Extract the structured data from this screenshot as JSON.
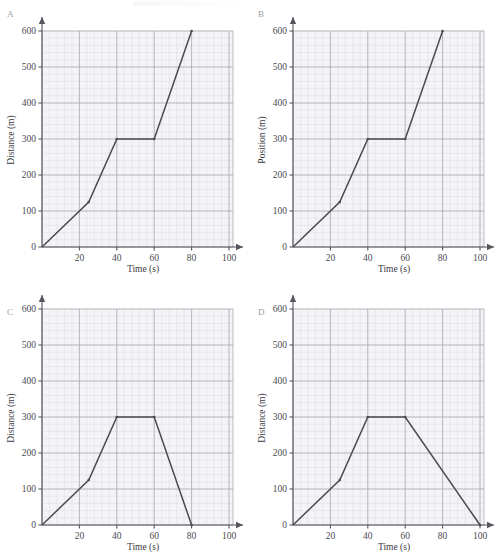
{
  "figure": {
    "panel_count": 4,
    "line_color": "#4a4a52",
    "grid_major_color": "#a8a8b2",
    "grid_minor_color": "#d9d9df",
    "plot_background": "#f4f4f6"
  },
  "chart_data": [
    {
      "type": "line",
      "panel": "A",
      "title": "",
      "xlabel": "Time (s)",
      "ylabel": "Distance (m)",
      "xlim": [
        0,
        100
      ],
      "ylim": [
        0,
        600
      ],
      "xticks": [
        0,
        20,
        40,
        60,
        80,
        100
      ],
      "yticks": [
        0,
        100,
        200,
        300,
        400,
        500,
        600
      ],
      "xtick_labels": [
        "0",
        "20",
        "40",
        "60",
        "80",
        "100"
      ],
      "ytick_labels": [
        "0",
        "100",
        "200",
        "300",
        "400",
        "500",
        "600"
      ],
      "grid": true,
      "minor_grid": true,
      "legend": "none",
      "x": [
        0,
        25,
        40,
        60,
        80
      ],
      "y": [
        0,
        125,
        300,
        300,
        600
      ],
      "series": [
        {
          "name": "distance",
          "points": [
            [
              0,
              0
            ],
            [
              25,
              125
            ],
            [
              40,
              300
            ],
            [
              60,
              300
            ],
            [
              80,
              600
            ]
          ]
        }
      ]
    },
    {
      "type": "line",
      "panel": "B",
      "title": "",
      "xlabel": "Time (s)",
      "ylabel": "Position (m)",
      "xlim": [
        0,
        100
      ],
      "ylim": [
        0,
        600
      ],
      "xticks": [
        0,
        20,
        40,
        60,
        80,
        100
      ],
      "yticks": [
        0,
        100,
        200,
        300,
        400,
        500,
        600
      ],
      "xtick_labels": [
        "0",
        "20",
        "40",
        "60",
        "80",
        "100"
      ],
      "ytick_labels": [
        "0",
        "100",
        "200",
        "300",
        "400",
        "500",
        "600"
      ],
      "grid": true,
      "minor_grid": true,
      "legend": "none",
      "x": [
        0,
        25,
        40,
        60,
        80
      ],
      "y": [
        0,
        125,
        300,
        300,
        600
      ],
      "series": [
        {
          "name": "position",
          "points": [
            [
              0,
              0
            ],
            [
              25,
              125
            ],
            [
              40,
              300
            ],
            [
              60,
              300
            ],
            [
              80,
              600
            ]
          ]
        }
      ]
    },
    {
      "type": "line",
      "panel": "C",
      "title": "",
      "xlabel": "Time (s)",
      "ylabel": "Distance (m)",
      "xlim": [
        0,
        100
      ],
      "ylim": [
        0,
        600
      ],
      "xticks": [
        0,
        20,
        40,
        60,
        80,
        100
      ],
      "yticks": [
        0,
        100,
        200,
        300,
        400,
        500,
        600
      ],
      "xtick_labels": [
        "0",
        "20",
        "40",
        "60",
        "80",
        "100"
      ],
      "ytick_labels": [
        "0",
        "100",
        "200",
        "300",
        "400",
        "500",
        "600"
      ],
      "grid": true,
      "minor_grid": true,
      "legend": "none",
      "x": [
        0,
        25,
        40,
        60,
        80
      ],
      "y": [
        0,
        125,
        300,
        300,
        0
      ],
      "series": [
        {
          "name": "distance",
          "points": [
            [
              0,
              0
            ],
            [
              25,
              125
            ],
            [
              40,
              300
            ],
            [
              60,
              300
            ],
            [
              80,
              0
            ]
          ]
        }
      ]
    },
    {
      "type": "line",
      "panel": "D",
      "title": "",
      "xlabel": "Time (s)",
      "ylabel": "Distance (m)",
      "xlim": [
        0,
        100
      ],
      "ylim": [
        0,
        600
      ],
      "xticks": [
        0,
        20,
        40,
        60,
        80,
        100
      ],
      "yticks": [
        0,
        100,
        200,
        300,
        400,
        500,
        600
      ],
      "xtick_labels": [
        "0",
        "20",
        "40",
        "60",
        "80",
        "100"
      ],
      "ytick_labels": [
        "0",
        "100",
        "200",
        "300",
        "400",
        "500",
        "600"
      ],
      "grid": true,
      "minor_grid": true,
      "legend": "none",
      "x": [
        0,
        25,
        40,
        60,
        100
      ],
      "y": [
        0,
        125,
        300,
        300,
        0
      ],
      "series": [
        {
          "name": "distance",
          "points": [
            [
              0,
              0
            ],
            [
              25,
              125
            ],
            [
              40,
              300
            ],
            [
              60,
              300
            ],
            [
              100,
              0
            ]
          ]
        }
      ]
    }
  ],
  "panels": {
    "A": {
      "letter": "A",
      "xlabel": "Time (s)",
      "ylabel": "Distance (m)",
      "xtick_labels": [
        "0",
        "20",
        "40",
        "60",
        "80",
        "100"
      ],
      "ytick_labels": [
        "0",
        "100",
        "200",
        "300",
        "400",
        "500",
        "600"
      ]
    },
    "B": {
      "letter": "B",
      "xlabel": "Time (s)",
      "ylabel": "Position (m)",
      "xtick_labels": [
        "0",
        "20",
        "40",
        "60",
        "80",
        "100"
      ],
      "ytick_labels": [
        "0",
        "100",
        "200",
        "300",
        "400",
        "500",
        "600"
      ]
    },
    "C": {
      "letter": "C",
      "xlabel": "Time (s)",
      "ylabel": "Distance (m)",
      "xtick_labels": [
        "0",
        "20",
        "40",
        "60",
        "80",
        "100"
      ],
      "ytick_labels": [
        "0",
        "100",
        "200",
        "300",
        "400",
        "500",
        "600"
      ]
    },
    "D": {
      "letter": "D",
      "xlabel": "Time (s)",
      "ylabel": "Distance (m)",
      "xtick_labels": [
        "0",
        "20",
        "40",
        "60",
        "80",
        "100"
      ],
      "ytick_labels": [
        "0",
        "100",
        "200",
        "300",
        "400",
        "500",
        "600"
      ]
    }
  }
}
